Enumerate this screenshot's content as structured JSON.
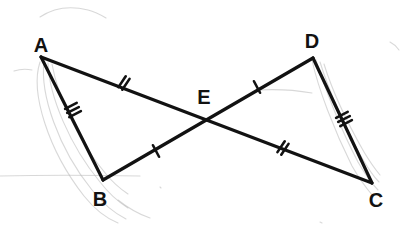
{
  "figure": {
    "background_color": "#ffffff",
    "stroke_color": "#121212",
    "sketch_color": "#b8b8b8",
    "stroke_width": 3.2,
    "tick_width": 2.6,
    "points": {
      "A": {
        "x": 41,
        "y": 57,
        "label": "A",
        "label_x": 41,
        "label_y": 45
      },
      "B": {
        "x": 103,
        "y": 180,
        "label": "B",
        "label_x": 100,
        "label_y": 199
      },
      "C": {
        "x": 372,
        "y": 183,
        "label": "C",
        "label_x": 376,
        "label_y": 200
      },
      "D": {
        "x": 313,
        "y": 58,
        "label": "D",
        "label_x": 312,
        "label_y": 41
      },
      "E": {
        "x": 208,
        "y": 119,
        "label": "E",
        "label_x": 204,
        "label_y": 97
      }
    },
    "segments": [
      {
        "name": "AB",
        "from": "A",
        "to": "B",
        "ticks": 3,
        "tick_at": 0.44
      },
      {
        "name": "AC",
        "from": "A",
        "to": "C",
        "ticks": 0,
        "tick_at": 0.5
      },
      {
        "name": "BD",
        "from": "B",
        "to": "D",
        "ticks": 0,
        "tick_at": 0.5
      },
      {
        "name": "DC",
        "from": "D",
        "to": "C",
        "ticks": 3,
        "tick_at": 0.48
      }
    ],
    "tick_marks": [
      {
        "name": "tick-AE",
        "segment": "AE",
        "count": 2,
        "x": 124,
        "y": 83,
        "angle_deg": 34
      },
      {
        "name": "tick-EC",
        "segment": "EC",
        "count": 2,
        "x": 283,
        "y": 148,
        "angle_deg": 34
      },
      {
        "name": "tick-BE",
        "segment": "BE",
        "count": 1,
        "x": 156,
        "y": 151,
        "angle_deg": -28
      },
      {
        "name": "tick-ED",
        "segment": "ED",
        "count": 1,
        "x": 257,
        "y": 87,
        "angle_deg": -28
      },
      {
        "name": "tick-AB",
        "segment": "AB",
        "count": 3,
        "x": 73,
        "y": 110,
        "angle_deg": 63
      },
      {
        "name": "tick-DC",
        "segment": "DC",
        "count": 3,
        "x": 344,
        "y": 119,
        "angle_deg": 63
      }
    ],
    "sketch_strokes": [
      {
        "name": "sketch-top-arc",
        "d": "M 40 17 C 55 7, 72 6, 88 10 C 96 12, 101 15, 106 18"
      },
      {
        "name": "sketch-left-arc-1",
        "d": "M 40 62 C 30 92, 48 150, 84 196 C 96 211, 108 219, 118 223"
      },
      {
        "name": "sketch-left-arc-2",
        "d": "M 44 62 C 40 94, 58 148, 92 190 C 104 205, 116 214, 126 219"
      },
      {
        "name": "sketch-left-arc-3",
        "d": "M 48 63 C 49 96, 70 146, 100 182 C 110 195, 120 203, 128 208"
      },
      {
        "name": "sketch-left-arc-4",
        "d": "M 52 64 C 58 98, 80 144, 106 174 C 114 184, 122 190, 128 194"
      },
      {
        "name": "sketch-left-small",
        "d": "M 14 71 C 20 69, 27 69, 32 70"
      },
      {
        "name": "sketch-right-arc-1",
        "d": "M 316 60 C 324 86, 340 128, 358 162 C 366 176, 372 184, 378 190"
      },
      {
        "name": "sketch-right-arc-2",
        "d": "M 320 62 C 328 88, 344 126, 362 158 C 369 170, 374 177, 379 182"
      },
      {
        "name": "sketch-right-arc-3",
        "d": "M 324 64 C 332 90, 348 124, 364 152 C 370 162, 375 169, 380 175"
      },
      {
        "name": "sketch-right-arc-4",
        "d": "M 312 60 C 318 88, 334 130, 352 166 C 360 180, 367 189, 373 196"
      },
      {
        "name": "sketch-mid-line",
        "d": "M 258 90 C 276 89, 295 90, 312 93"
      },
      {
        "name": "sketch-bottom-line",
        "d": "M 0 176 C 40 175, 90 175, 140 176"
      },
      {
        "name": "sketch-bottom-curve",
        "d": "M 118 200 C 128 208, 138 214, 150 218"
      },
      {
        "name": "sketch-right-tip",
        "d": "M 390 42 C 394 44, 397 47, 399 50"
      },
      {
        "name": "sketch-dot-mid",
        "d": "M 160 187 L 161 188"
      },
      {
        "name": "sketch-dot-lower",
        "d": "M 320 222 L 322 223"
      }
    ]
  }
}
